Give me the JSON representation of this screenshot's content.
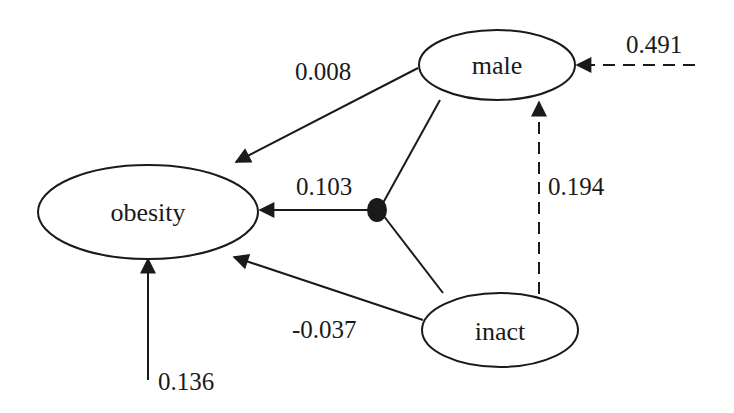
{
  "diagram": {
    "type": "path-diagram",
    "colors": {
      "stroke": "#1a1a1a",
      "background": "#ffffff"
    },
    "nodes": [
      {
        "id": "obesity",
        "label": "obesity"
      },
      {
        "id": "male",
        "label": "male"
      },
      {
        "id": "inact",
        "label": "inact"
      }
    ],
    "edges": [
      {
        "from": "male",
        "to": "obesity",
        "label": "0.008",
        "style": "solid"
      },
      {
        "from": "interaction(male,inact)",
        "to": "obesity",
        "label": "0.103",
        "style": "solid"
      },
      {
        "from": "inact",
        "to": "obesity",
        "label": "-0.037",
        "style": "solid"
      },
      {
        "from": "error",
        "to": "obesity",
        "label": "0.136",
        "style": "solid"
      },
      {
        "from": "error",
        "to": "male",
        "label": "0.491",
        "style": "dashed"
      },
      {
        "from": "inact",
        "to": "male",
        "label": "0.194",
        "style": "dashed"
      }
    ],
    "junction": {
      "label": "interaction",
      "connects": [
        "male",
        "inact"
      ]
    }
  }
}
